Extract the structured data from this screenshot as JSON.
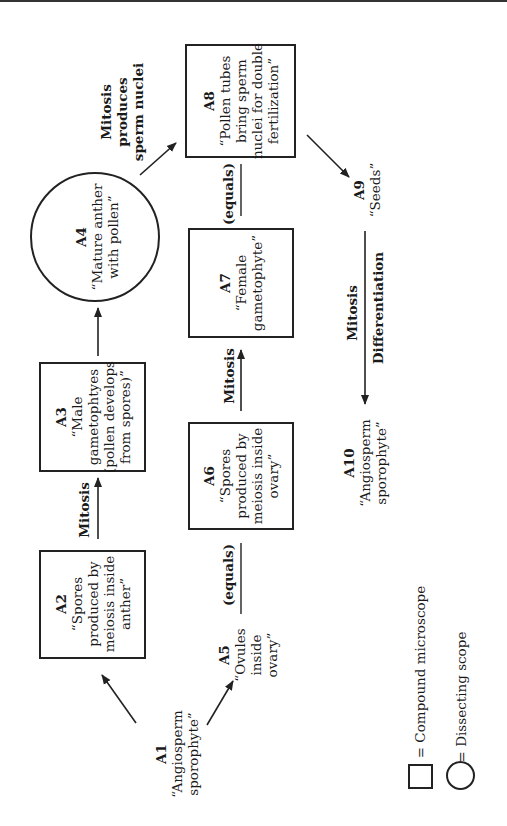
{
  "nodes": {
    "A1": {
      "id": "A1",
      "lines": [
        "“Angiosperm",
        "sporophyte”"
      ]
    },
    "A2": {
      "id": "A2",
      "lines": [
        "“Spores",
        "produced by",
        "meiosis inside",
        "anther”"
      ]
    },
    "A3": {
      "id": "A3",
      "lines": [
        "“Male",
        "gametophtyes",
        "(pollen develops",
        "from spores)”"
      ]
    },
    "A4": {
      "id": "A4",
      "lines": [
        "“Mature anther",
        "with pollen”"
      ]
    },
    "A5": {
      "id": "A5",
      "lines": [
        "“Ovules",
        "inside",
        "ovary”"
      ]
    },
    "A6": {
      "id": "A6",
      "lines": [
        "“Spores",
        "produced by",
        "meiosis inside",
        "ovary”"
      ]
    },
    "A7": {
      "id": "A7",
      "lines": [
        "“Female",
        "gametophyte”"
      ]
    },
    "A8": {
      "id": "A8",
      "lines": [
        "“Pollen tubes",
        "bring sperm",
        "nuclei for double",
        "fertilization”"
      ]
    },
    "A9": {
      "id": "A9",
      "lines": [
        "“Seeds”"
      ]
    },
    "A10": {
      "id": "A10",
      "lines": [
        "“Angiosperm",
        "sporophyte”"
      ]
    }
  },
  "edge_labels": {
    "mitosis_a2_a3": "Mitosis",
    "mitosis_a6_a7": "Mitosis",
    "equals_a2_a5": "(equals)",
    "equals_a7_a8": "(equals)",
    "a4_a8": [
      "Mitosis",
      "produces",
      "sperm nuclei"
    ],
    "a9_a10_1": "Mitosis",
    "a9_a10_2": "Differentiation"
  },
  "legend": {
    "square": "=   Compound microscope",
    "circle": "=   Dissecting scope"
  },
  "colors": {
    "stroke": "#222222",
    "text": "#1a1a1a"
  }
}
